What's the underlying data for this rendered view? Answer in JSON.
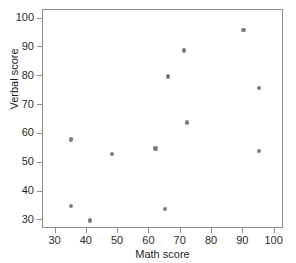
{
  "chart_data": {
    "type": "scatter",
    "title": "",
    "xlabel": "Math score",
    "ylabel": "Verbal score",
    "xlim": [
      26,
      103
    ],
    "ylim": [
      27,
      103
    ],
    "xticks": [
      30,
      40,
      50,
      60,
      70,
      80,
      90,
      100
    ],
    "yticks": [
      30,
      40,
      50,
      60,
      70,
      80,
      90,
      100
    ],
    "xticklabels": [
      "30",
      "40",
      "50",
      "60",
      "70",
      "80",
      "90",
      "100"
    ],
    "yticklabels": [
      "30",
      "40",
      "50",
      "60",
      "70",
      "80",
      "90",
      "100"
    ],
    "grid": false,
    "legend": false,
    "marker_color": "#7c7c7c",
    "frame_color": "#8d8d8d",
    "background": "#ffffff",
    "series": [
      {
        "name": "students",
        "x": [
          35,
          35,
          41,
          48,
          62,
          65,
          66,
          71,
          72,
          90,
          95,
          95
        ],
        "y": [
          58,
          35,
          30,
          53,
          55,
          34,
          80,
          89,
          64,
          96,
          76,
          54
        ]
      }
    ]
  }
}
